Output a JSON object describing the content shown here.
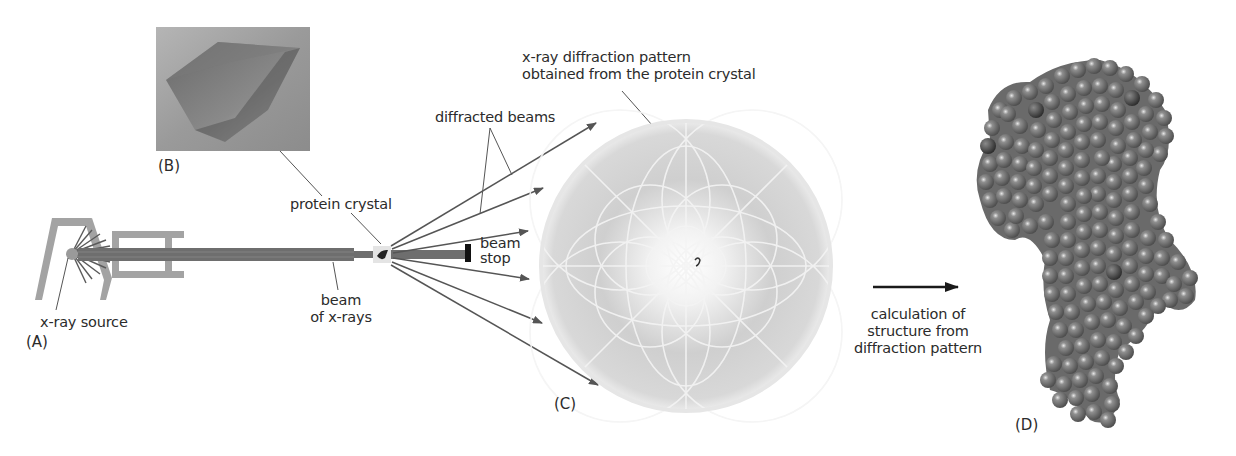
{
  "figure": {
    "panels": {
      "A": "(A)",
      "B": "(B)",
      "C": "(C)",
      "D": "(D)"
    },
    "labels": {
      "xray_source": "x-ray source",
      "beam_line1": "beam",
      "beam_line2": "of x-rays",
      "protein_crystal": "protein crystal",
      "beam_stop_line1": "beam",
      "beam_stop_line2": "stop",
      "diffracted_beams": "diffracted beams",
      "diffraction_pattern_line1": "x-ray diffraction pattern",
      "diffraction_pattern_line2": "obtained from the protein crystal",
      "calc_line1": "calculation of",
      "calc_line2": "structure from",
      "calc_line3": "diffraction pattern"
    },
    "colors": {
      "apparatus": "#a3a3a3",
      "beam": "#6e6e6e",
      "arrow": "#555555",
      "leader": "#555555",
      "beam_stop": "#111111",
      "protein_atom": "#7d7d7d",
      "pattern_bg": "#d6d6d6"
    }
  }
}
